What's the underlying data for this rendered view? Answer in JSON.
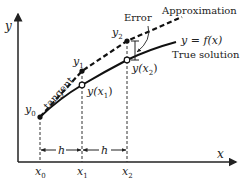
{
  "diagram": {
    "axes": {
      "x_label": "x",
      "y_label": "y"
    },
    "x_ticks": [
      {
        "base": "x",
        "sub": "0"
      },
      {
        "base": "x",
        "sub": "1"
      },
      {
        "base": "x",
        "sub": "2"
      }
    ],
    "step_label": "h",
    "points": {
      "y0": {
        "base": "y",
        "sub": "0"
      },
      "y1": {
        "base": "y",
        "sub": "1"
      },
      "y2": {
        "base": "y",
        "sub": "2"
      },
      "yx1": {
        "pre": "y(",
        "base": "x",
        "sub": "1",
        "post": ")"
      },
      "yx2": {
        "pre": "y(",
        "base": "x",
        "sub": "2",
        "post": ")"
      }
    },
    "labels": {
      "tangent": "tangent",
      "error": "Error",
      "approximation": "Approximation",
      "true_eq_pre": "y = ",
      "true_eq_f": "f",
      "true_eq_post": "(x)",
      "true_solution": "True solution"
    },
    "colors": {
      "ink": "#222222",
      "background": "#ffffff"
    }
  }
}
